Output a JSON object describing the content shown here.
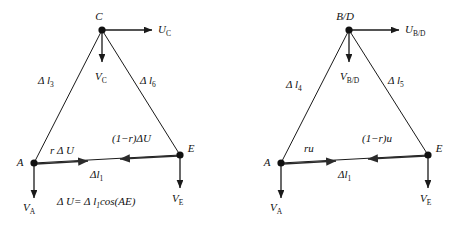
{
  "figure": {
    "type": "vector-force-diagram",
    "background_color": "#ffffff",
    "line_color": "#1a1a1a",
    "panels": [
      {
        "id": "left-panel",
        "name": "triangle-ACE",
        "apex_label": "C",
        "apex_u_label": "U",
        "apex_u_subscript": "C",
        "apex_v_label": "V",
        "apex_v_subscript": "C",
        "left_vertex_label": "A",
        "right_vertex_label": "E",
        "left_vertex_v_label": "V",
        "left_vertex_v_subscript": "A",
        "right_vertex_v_label": "V",
        "right_vertex_v_subscript": "E",
        "left_side_label": "Δ l",
        "left_side_subscript": "3",
        "right_side_label": "Δ l",
        "right_side_subscript": "6",
        "base_label": "Δl",
        "base_subscript": "1",
        "base_left_arrow_label": "r Δ U",
        "base_right_arrow_label": "(1−r)ΔU",
        "equation": "Δ U= Δ l",
        "equation_subscript": "1",
        "equation_tail": "cos(AE)"
      },
      {
        "id": "right-panel",
        "name": "triangle-ABDE",
        "apex_label": "B/D",
        "apex_u_label": "U",
        "apex_u_subscript": "B/D",
        "apex_v_label": "V",
        "apex_v_subscript": "B/D",
        "left_vertex_label": "A",
        "right_vertex_label": "E",
        "left_vertex_v_label": "V",
        "left_vertex_v_subscript": "A",
        "right_vertex_v_label": "V",
        "right_vertex_v_subscript": "E",
        "left_side_label": "Δ l",
        "left_side_subscript": "4",
        "right_side_label": "Δ l",
        "right_side_subscript": "5",
        "base_label": "Δl",
        "base_subscript": "1",
        "base_left_arrow_label": "ru",
        "base_right_arrow_label": "(1−r)u"
      }
    ]
  }
}
